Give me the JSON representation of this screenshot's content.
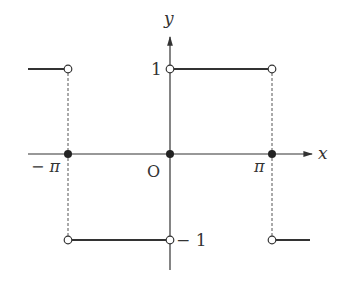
{
  "diagram": {
    "axes": {
      "x_label": "x",
      "y_label": "y",
      "origin_label": "O"
    },
    "tick_labels": {
      "neg_pi": "− π",
      "pi": "π",
      "one": "1",
      "neg_one": "− 1"
    },
    "colors": {
      "line": "#333333",
      "dashed": "#555555",
      "background": "#ffffff"
    },
    "segments": [
      {
        "from": "-inf",
        "to": "-pi",
        "value": 1,
        "description": "left partial segment"
      },
      {
        "from": "-pi",
        "to": "0",
        "value": -1
      },
      {
        "from": "0",
        "to": "pi",
        "value": 1
      },
      {
        "from": "pi",
        "to": "+inf",
        "value": -1,
        "description": "right partial segment"
      }
    ],
    "filled_points": [
      {
        "x": "-pi",
        "y": 0
      },
      {
        "x": "0",
        "y": 0
      },
      {
        "x": "pi",
        "y": 0
      }
    ],
    "open_points": [
      {
        "x": "-pi",
        "y": 1
      },
      {
        "x": "-pi",
        "y": -1
      },
      {
        "x": "0",
        "y": 1
      },
      {
        "x": "0",
        "y": -1
      },
      {
        "x": "pi",
        "y": 1
      },
      {
        "x": "pi",
        "y": -1
      }
    ]
  }
}
